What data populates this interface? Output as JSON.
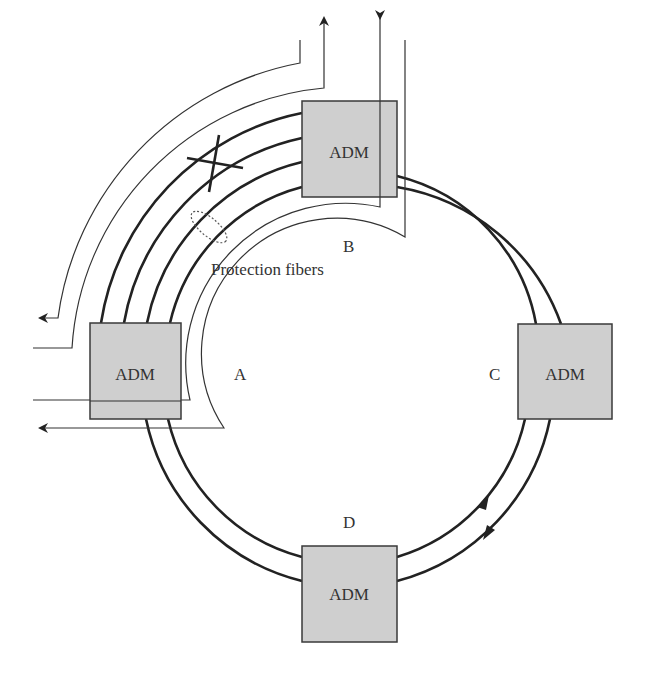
{
  "diagram": {
    "type": "SONET/SDH bidirectional line-switched ring with protection switching",
    "nodes": [
      {
        "id": "A",
        "label": "A",
        "box_label": "ADM"
      },
      {
        "id": "B",
        "label": "B",
        "box_label": "ADM"
      },
      {
        "id": "C",
        "label": "C",
        "box_label": "ADM"
      },
      {
        "id": "D",
        "label": "D",
        "box_label": "ADM"
      }
    ],
    "annotations": {
      "protection_fibers": "Protection fibers",
      "failure_marker": "X"
    },
    "colors": {
      "adm_fill": "#cfcfcf",
      "line": "#222222",
      "background": "#ffffff"
    }
  }
}
